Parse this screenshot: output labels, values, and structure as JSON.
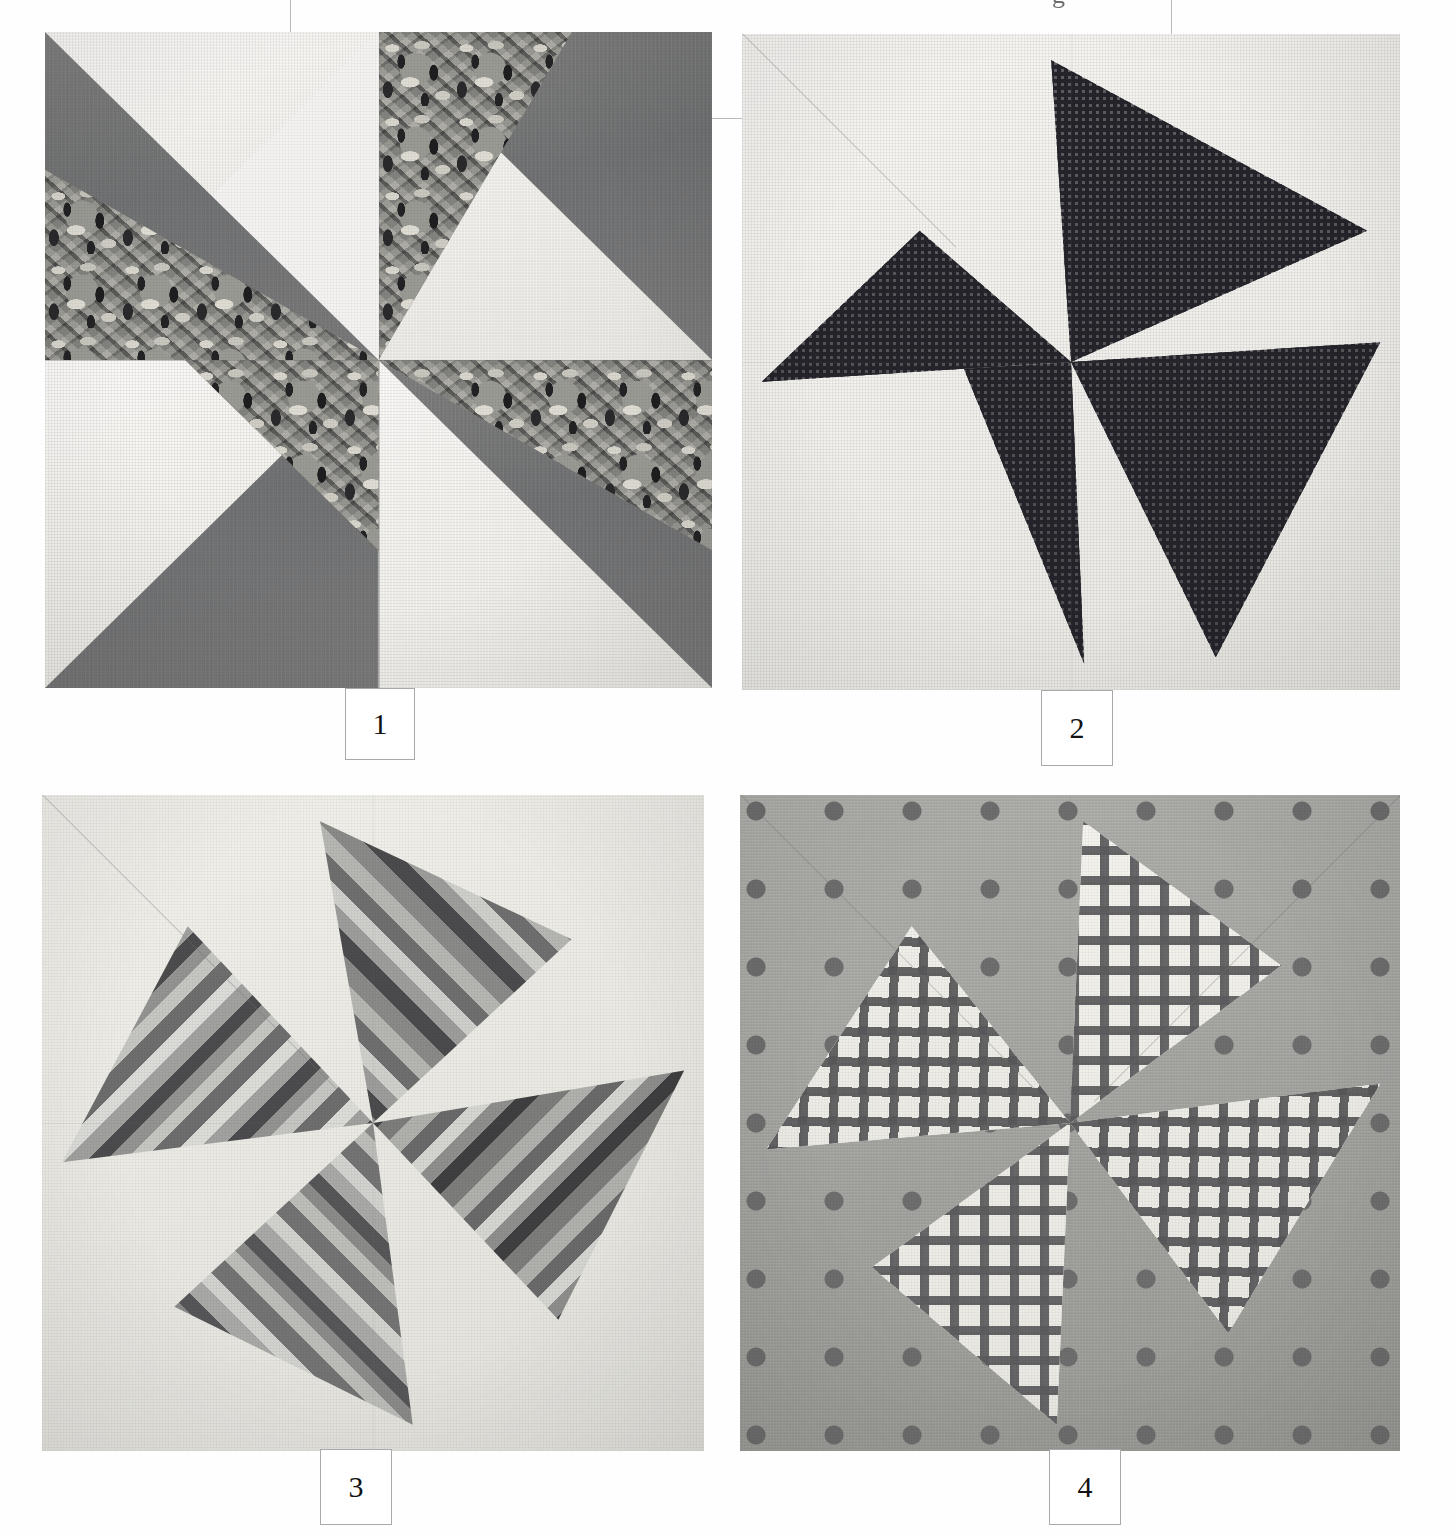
{
  "page": {
    "kind": "quilt-block-photo-plate",
    "background_color": "#ffffff",
    "partial_glyph_top": "g",
    "crop_marks_visible": true
  },
  "blocks": [
    {
      "number": "1",
      "name": "pinwheel-block-floral",
      "caption": "1",
      "background_fabric": "white muslin",
      "fabrics": [
        "solid medium gray",
        "large-scale floral print",
        "white"
      ],
      "colors": {
        "solid": "#737374",
        "print_base": "#8a8a86",
        "print_dark": "#232325",
        "print_light": "#d8d6cd",
        "white": "#f4f3ef"
      },
      "vanes": 4,
      "rotation": "counter-clockwise"
    },
    {
      "number": "2",
      "name": "pinwheel-block-check",
      "caption": "2",
      "background_fabric": "white muslin",
      "fabrics": [
        "fine dark check / gingham",
        "white"
      ],
      "colors": {
        "check_dark": "#24242a",
        "check_light": "#f0efe9",
        "white": "#f6f5f1"
      },
      "vanes": 4,
      "rotation": "counter-clockwise"
    },
    {
      "number": "3",
      "name": "pinwheel-block-stripe",
      "caption": "3",
      "background_fabric": "pale gray solid",
      "fabrics": [
        "multi-tone diagonal stripe",
        "pale gray solid"
      ],
      "colors": {
        "stripe_darkest": "#3f3f41",
        "stripe_mid": "#8b8b8a",
        "stripe_light": "#d5d5d1",
        "background": "#e9e8e3"
      },
      "vanes": 4,
      "rotation": "counter-clockwise"
    },
    {
      "number": "4",
      "name": "pinwheel-block-dot-plaid",
      "caption": "4",
      "background_fabric": "gray polka dot",
      "fabrics": [
        "gray polka dot",
        "painterly plaid / windowpane check"
      ],
      "colors": {
        "dot_ground": "#a6a6a2",
        "dot": "#6e6e6e",
        "plaid_line": "#5c5c5e",
        "plaid_ground": "#efeee8"
      },
      "vanes": 4,
      "rotation": "counter-clockwise"
    }
  ]
}
